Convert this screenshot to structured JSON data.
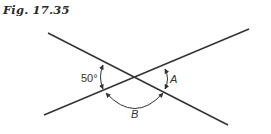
{
  "figure": {
    "title": "Fig. 17.35"
  },
  "diagram": {
    "type": "intersecting-lines-angles",
    "line_color": "#333333",
    "lines": [
      {
        "id": "line-1",
        "from": [
          48,
          33
        ],
        "to": [
          228,
          125
        ]
      },
      {
        "id": "line-2",
        "from": [
          44,
          115
        ],
        "to": [
          249,
          29
        ]
      }
    ],
    "intersection": [
      135,
      78
    ],
    "angles": [
      {
        "id": "angle-left",
        "label": "50°",
        "position": "left"
      },
      {
        "id": "angle-A",
        "label": "A",
        "position": "right"
      },
      {
        "id": "angle-B",
        "label": "B",
        "position": "bottom"
      }
    ]
  }
}
